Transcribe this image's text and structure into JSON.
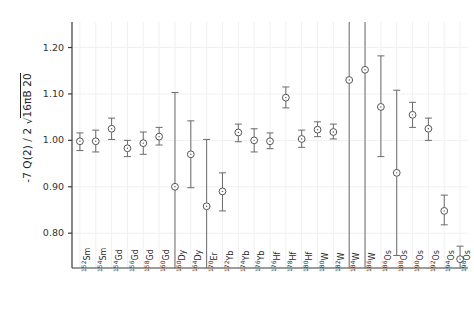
{
  "chart_data": {
    "type": "scatter",
    "title": "",
    "subtitle": "",
    "xlabel": "",
    "ylabel": "-7 Q(2) / 2 √16πB 20",
    "ylabel_parts": {
      "prefix": "-7 Q(2) / 2 ",
      "radicand": "16πB 20"
    },
    "ylim": [
      0.725,
      1.255
    ],
    "yticks": [
      0.8,
      0.9,
      1.0,
      1.1,
      1.2
    ],
    "ytick_labels": [
      "0.80",
      "0.90",
      "1.00",
      "1.10",
      "1.20"
    ],
    "grid": "both-light",
    "legend": "none",
    "marker": "open-circle-with-dot",
    "error_bars": "vertical-capped",
    "categories": [
      "152Sm",
      "154Sm",
      "154Gd",
      "156Gd",
      "158Gd",
      "160Gd",
      "160Dy",
      "164Dy",
      "170Er",
      "172Yb",
      "174Yb",
      "176Yb",
      "176Hf",
      "178Hf",
      "180Hf",
      "180W",
      "182W",
      "184W",
      "186W",
      "186Os",
      "188Os",
      "190Os",
      "192Os",
      "194Os",
      "196Os"
    ],
    "category_labels": [
      {
        "mass": "152",
        "element": "Sm"
      },
      {
        "mass": "154",
        "element": "Sm"
      },
      {
        "mass": "154",
        "element": "Gd"
      },
      {
        "mass": "156",
        "element": "Gd"
      },
      {
        "mass": "158",
        "element": "Gd"
      },
      {
        "mass": "160",
        "element": "Gd"
      },
      {
        "mass": "160",
        "element": "Dy"
      },
      {
        "mass": "164",
        "element": "Dy"
      },
      {
        "mass": "170",
        "element": "Er"
      },
      {
        "mass": "172",
        "element": "Yb"
      },
      {
        "mass": "174",
        "element": "Yb"
      },
      {
        "mass": "176",
        "element": "Yb"
      },
      {
        "mass": "176",
        "element": "Hf"
      },
      {
        "mass": "178",
        "element": "Hf"
      },
      {
        "mass": "180",
        "element": "Hf"
      },
      {
        "mass": "180",
        "element": "W"
      },
      {
        "mass": "182",
        "element": "W"
      },
      {
        "mass": "184",
        "element": "W"
      },
      {
        "mass": "186",
        "element": "W"
      },
      {
        "mass": "186",
        "element": "Os"
      },
      {
        "mass": "188",
        "element": "Os"
      },
      {
        "mass": "190",
        "element": "Os"
      },
      {
        "mass": "192",
        "element": "Os"
      },
      {
        "mass": "194",
        "element": "Os"
      },
      {
        "mass": "196",
        "element": "Os"
      }
    ],
    "values": [
      0.998,
      0.998,
      1.025,
      0.983,
      0.994,
      1.008,
      0.9,
      0.97,
      0.858,
      0.89,
      1.017,
      1.0,
      0.998,
      1.092,
      1.003,
      1.023,
      1.018,
      1.13,
      1.152,
      1.072,
      0.93,
      1.055,
      1.025,
      0.848,
      0.744
    ],
    "err_low": [
      0.978,
      0.975,
      1.002,
      0.965,
      0.97,
      0.99,
      0.728,
      0.898,
      0.782,
      0.848,
      0.997,
      0.975,
      0.982,
      1.07,
      0.985,
      1.008,
      1.003,
      0.92,
      0.84,
      0.965,
      0.752,
      1.028,
      1.0,
      0.818,
      0.716
    ],
    "err_high": [
      1.016,
      1.022,
      1.048,
      1.0,
      1.018,
      1.028,
      1.103,
      1.042,
      1.002,
      0.93,
      1.035,
      1.025,
      1.016,
      1.115,
      1.022,
      1.04,
      1.035,
      1.265,
      1.262,
      1.182,
      1.108,
      1.082,
      1.048,
      0.882,
      0.772
    ],
    "clipped_top": [
      false,
      false,
      false,
      false,
      false,
      false,
      false,
      false,
      false,
      false,
      false,
      false,
      false,
      false,
      false,
      false,
      false,
      true,
      true,
      false,
      false,
      false,
      false,
      false,
      false
    ],
    "clipped_bottom": [
      false,
      false,
      false,
      false,
      false,
      false,
      true,
      false,
      true,
      false,
      false,
      false,
      false,
      false,
      false,
      false,
      false,
      true,
      true,
      false,
      false,
      false,
      false,
      false,
      true
    ],
    "colors": {
      "marker_edge": "#555555",
      "marker_face": "#ffffff",
      "error_bar": "#6a6a6a",
      "grid": "#f0f0f0",
      "axis": "#3a3a3a",
      "text": "#2b2b2b"
    }
  }
}
